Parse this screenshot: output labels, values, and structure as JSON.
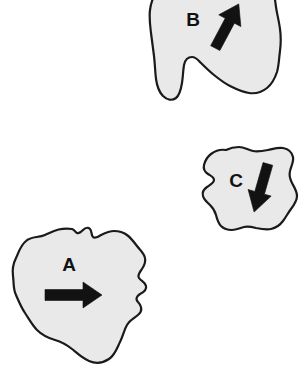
{
  "figure": {
    "title": "",
    "background_color": "#ffffff",
    "width": 308,
    "height": 382
  },
  "style": {
    "blob_fill": "#e9e9e9",
    "blob_stroke": "#1a1a1a",
    "arrow_color": "#121212",
    "label_color": "#111111"
  },
  "shapes": [
    {
      "id": "shape-a",
      "label": "A",
      "label_x": 69,
      "label_y": 271,
      "fill": "#e9e9e9",
      "arrow": {
        "name": "arrow-a",
        "direction": "right",
        "angle_deg": 0,
        "from_x": 46,
        "from_y": 295,
        "to_x": 101,
        "to_y": 295
      }
    },
    {
      "id": "shape-b",
      "label": "B",
      "label_x": 193,
      "label_y": 26,
      "fill": "#e9e9e9",
      "arrow": {
        "name": "arrow-b",
        "direction": "up-right",
        "angle_deg": 62,
        "from_x": 213,
        "from_y": 47,
        "to_x": 242,
        "to_y": 6
      }
    },
    {
      "id": "shape-c",
      "label": "C",
      "label_x": 236,
      "label_y": 187,
      "fill": "#e9e9e9",
      "arrow": {
        "name": "arrow-c",
        "direction": "down-left",
        "angle_deg": -78,
        "from_x": 268,
        "from_y": 164,
        "to_x": 254,
        "to_y": 211
      }
    }
  ],
  "geometry": {
    "shape_a_path": "M 72,229 C 60,227 52,232 45,235 C 38,238 31,236 26,241 C 20,246 19,252 16,258 C 13,264 12,269 13,276 C 14,283 13,289 16,295 C 19,302 21,307 25,313 C 29,319 32,325 37,330 C 42,335 48,338 55,340 C 62,342 67,345 72,349 C 77,353 82,358 89,361 C 96,364 103,363 109,359 C 115,355 117,348 120,342 C 123,336 124,330 127,325 C 130,320 135,318 139,314 C 143,310 141,305 138,302 C 135,299 137,296 140,294 C 144,292 147,290 146,286 C 145,282 141,281 139,278 C 137,275 140,272 142,269 C 144,266 146,262 145,258 C 144,253 140,250 137,246 C 134,242 131,238 127,235 C 123,232 119,231 114,231 C 109,231 105,233 101,235 C 98,237 95,239 93,237 C 91,235 92,231 90,229 C 88,227 85,228 83,230 C 81,232 79,234 77,233 C 75,232 75,230 72,229 Z",
    "shape_b_path": "M 160,-12 C 154,-6 151,2 150,10 C 149,18 150,25 151,33 C 152,41 153,48 154,56 C 155,64 155,71 156,79 C 157,86 159,92 163,96 C 167,100 172,101 176,98 C 180,95 181,89 182,83 C 183,77 183,71 184,65 C 185,60 188,57 192,57 C 196,57 198,60 201,63 C 205,67 209,71 214,75 C 219,79 224,83 230,86 C 236,89 242,92 249,93 C 256,94 262,92 267,88 C 272,84 275,78 277,72 C 279,65 279,58 280,51 C 281,43 281,36 280,29 C 279,21 277,14 276,7 C 275,-1 274,-8 272,-14 L 160,-14 Z",
    "shape_c_path": "M 226,150 C 220,149 215,151 211,154 C 207,157 205,161 204,165 C 203,169 205,172 208,174 C 211,176 214,177 214,180 C 214,183 210,185 207,187 C 204,189 202,192 203,196 C 204,200 207,202 210,205 C 213,208 215,211 216,215 C 217,219 218,223 221,226 C 224,229 228,230 232,230 C 236,230 240,228 244,227 C 248,226 252,227 256,228 C 261,229 266,230 271,229 C 276,228 280,225 283,221 C 286,217 288,213 291,209 C 294,205 297,201 297,196 C 297,191 294,187 292,183 C 290,179 289,175 290,171 C 291,166 294,162 293,157 C 292,152 288,149 283,148 C 278,147 273,149 268,150 C 263,151 258,152 253,151 C 248,150 244,147 239,147 C 234,147 230,148 226,150 Z"
  }
}
